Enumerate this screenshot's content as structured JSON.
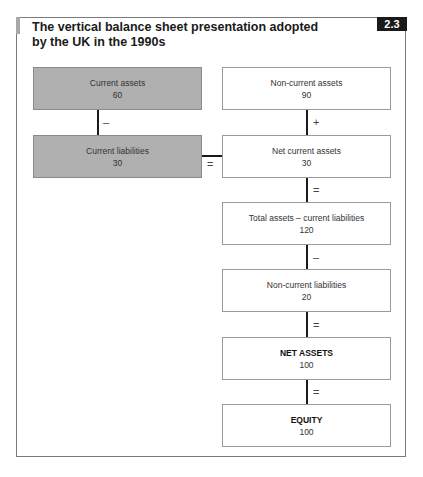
{
  "figure": {
    "title": "The vertical balance sheet presentation adopted by the UK in the 1990s",
    "title_line1": "The vertical balance sheet presentation adopted",
    "title_line2": "by the UK in the 1990s",
    "badge": "2.3"
  },
  "left_column": [
    {
      "label": "Current assets",
      "value": "60"
    },
    {
      "label": "Current liabilities",
      "value": "30"
    }
  ],
  "left_operators": {
    "between": "–",
    "to_right": "="
  },
  "right_column": [
    {
      "label": "Non-current assets",
      "value": "90"
    },
    {
      "label": "Net current assets",
      "value": "30"
    },
    {
      "label": "Total assets – current liabilities",
      "value": "120"
    },
    {
      "label": "Non-current liabilities",
      "value": "20"
    },
    {
      "label": "NET ASSETS",
      "value": "100"
    },
    {
      "label": "EQUITY",
      "value": "100"
    }
  ],
  "right_operators": [
    "+",
    "=",
    "–",
    "=",
    "="
  ],
  "colors": {
    "grey_box": "#b0b0b0",
    "white_box": "#ffffff",
    "line": "#1a1a1a",
    "badge_bg": "#1a1a1a"
  }
}
